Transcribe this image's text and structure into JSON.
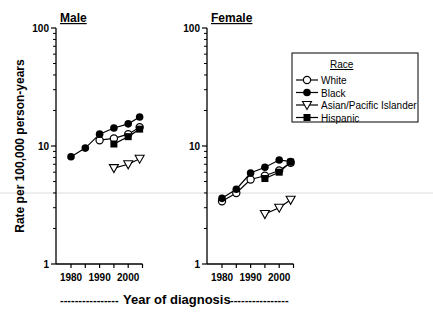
{
  "chart_data": [
    {
      "type": "line",
      "title": "Male",
      "xlabel": "Year of diagnosis",
      "ylabel": "Rate per 100,000 person-years",
      "yscale": "log",
      "ylim": [
        1,
        100
      ],
      "xlim": [
        1975,
        2005
      ],
      "xticks": [
        "1980",
        "1990",
        "2000"
      ],
      "yticks": [
        "1",
        "10",
        "100"
      ],
      "grid": false,
      "series": [
        {
          "name": "White",
          "marker": "open-circle",
          "x": [
            1990,
            1995,
            2000,
            2004
          ],
          "values": [
            11.2,
            11.6,
            12.6,
            14.4
          ]
        },
        {
          "name": "Black",
          "marker": "filled-circle",
          "x": [
            1980,
            1985,
            1990,
            1995,
            2000,
            2004
          ],
          "values": [
            8.1,
            9.6,
            12.6,
            14.2,
            15.4,
            17.6
          ]
        },
        {
          "name": "Asian/Pacific Islander",
          "marker": "open-triangle-down",
          "x": [
            1995,
            2000,
            2004
          ],
          "values": [
            6.5,
            7.0,
            7.8
          ]
        },
        {
          "name": "Hispanic",
          "marker": "filled-square",
          "x": [
            1995,
            2000,
            2004
          ],
          "values": [
            10.4,
            12.0,
            13.9
          ]
        }
      ]
    },
    {
      "type": "line",
      "title": "Female",
      "xlabel": "Year of diagnosis",
      "ylabel": "Rate per 100,000 person-years",
      "yscale": "log",
      "ylim": [
        1,
        100
      ],
      "xlim": [
        1975,
        2005
      ],
      "xticks": [
        "1980",
        "1990",
        "2000"
      ],
      "yticks": [
        "1",
        "10",
        "100"
      ],
      "grid": false,
      "legend": {
        "title": "Race",
        "position": "upper right"
      },
      "series": [
        {
          "name": "White",
          "marker": "open-circle",
          "x": [
            1980,
            1985,
            1990,
            1995,
            2000,
            2004
          ],
          "values": [
            3.4,
            4.0,
            5.2,
            5.6,
            6.2,
            7.2
          ]
        },
        {
          "name": "Black",
          "marker": "filled-circle",
          "x": [
            1980,
            1985,
            1990,
            1995,
            2000,
            2004
          ],
          "values": [
            3.6,
            4.3,
            5.9,
            6.6,
            7.6,
            7.4
          ]
        },
        {
          "name": "Asian/Pacific Islander",
          "marker": "open-triangle-down",
          "x": [
            1995,
            2000,
            2004
          ],
          "values": [
            2.65,
            3.0,
            3.5
          ]
        },
        {
          "name": "Hispanic",
          "marker": "filled-square",
          "x": [
            1995,
            2000,
            2004
          ],
          "values": [
            5.3,
            6.0,
            7.3
          ]
        }
      ]
    }
  ],
  "labels": {
    "male_title": "Male",
    "female_title": "Female",
    "ylabel": "Rate per 100,000 person-years",
    "xlabel": "Year of diagnosis",
    "xlabel_dashes_left": "----------------",
    "xlabel_dashes_right": "----------------",
    "ytick_100": "100",
    "ytick_10": "10",
    "ytick_1": "1",
    "xtick_1980": "1980",
    "xtick_1990": "1990",
    "xtick_2000": "2000"
  },
  "legend": {
    "title": "Race",
    "items": [
      "White",
      "Black",
      "Asian/Pacific Islander",
      "Hispanic"
    ]
  }
}
